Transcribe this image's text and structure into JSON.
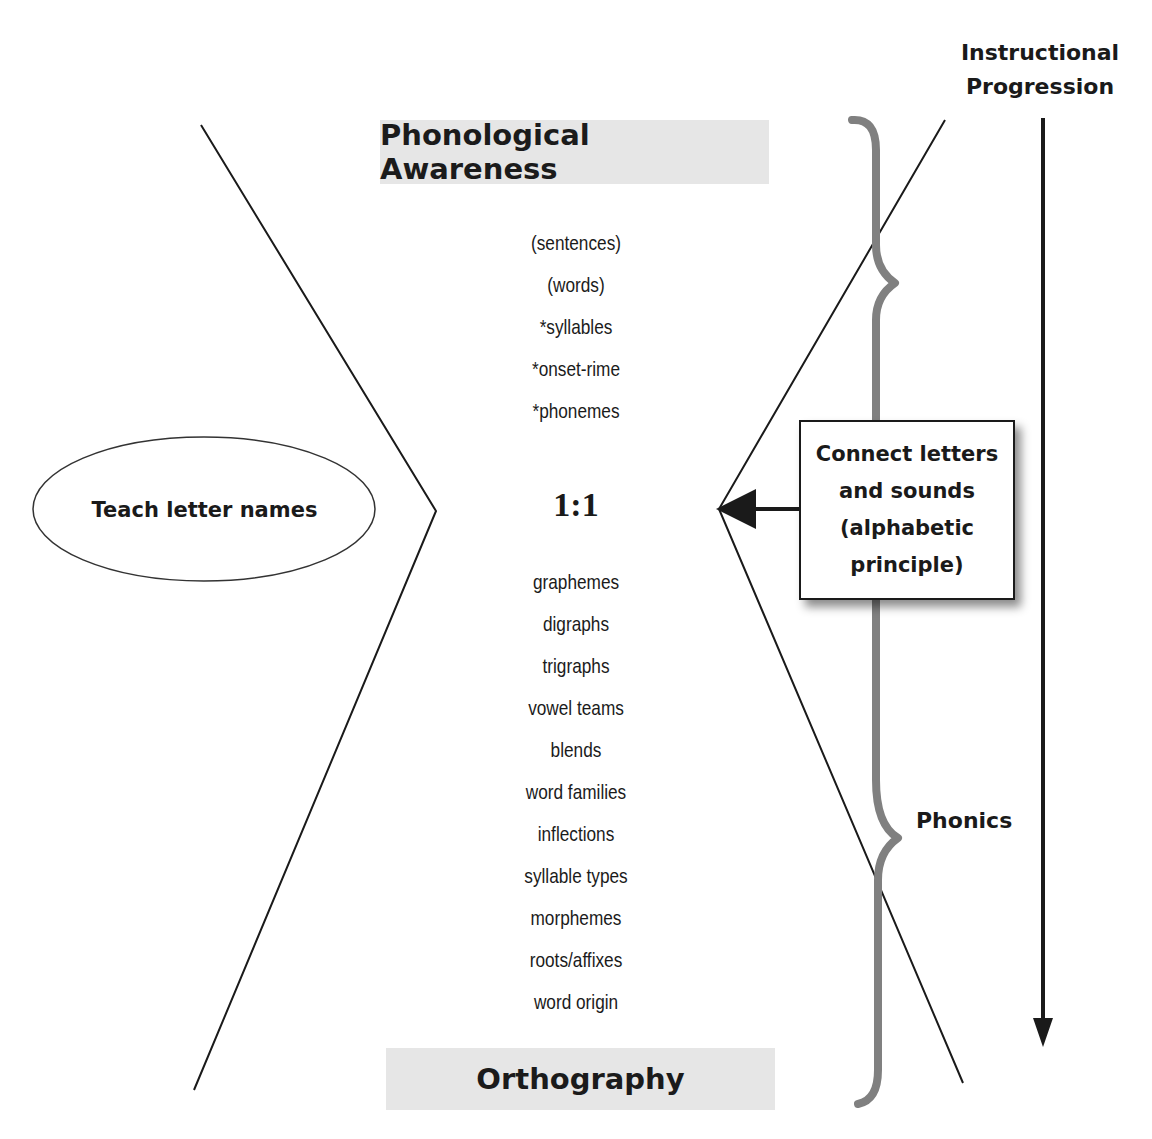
{
  "title_top": "Phonological Awareness",
  "title_bottom": "Orthography",
  "phonological_awareness_items": [
    "(sentences)",
    "(words)",
    "*syllables",
    "*onset-rime",
    "*phonemes"
  ],
  "ratio_label": "1:1",
  "orthography_items": [
    "graphemes",
    "digraphs",
    "trigraphs",
    "vowel teams",
    "blends",
    "word families",
    "inflections",
    "syllable types",
    "morphemes",
    "roots/affixes",
    "word origin"
  ],
  "ellipse_label": "Teach letter names",
  "connect_box": {
    "lines": [
      "Connect letters",
      "and sounds",
      "(alphabetic",
      "principle)"
    ]
  },
  "brace_label": "Phonics",
  "progression_label": {
    "lines": [
      "Instructional",
      "Progression"
    ]
  },
  "colors": {
    "line": "#1a1a1a",
    "brace": "#808080",
    "band": "#e6e6e6"
  }
}
